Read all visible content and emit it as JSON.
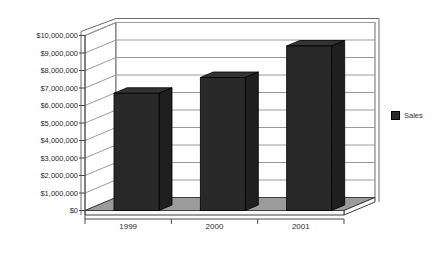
{
  "legend": {
    "label": "Sales",
    "swatch_color": "#292929"
  },
  "colors": {
    "background": "#ffffff",
    "bar_front": "#292929",
    "bar_top": "#333333",
    "bar_side": "#1f1f1f",
    "bar_edge": "#000000",
    "wall_fill": "#ffffff",
    "wall_border": "#6b6b6b",
    "gridline": "#9a9a9a",
    "floor_top": "#9b9b9b",
    "floor_side": "#f7f7f7",
    "floor_border": "#3f3f3f",
    "axis": "#4a4a4a",
    "text": "#2b2b2b"
  },
  "chart_data": {
    "type": "bar",
    "projection": "3d",
    "title": "",
    "xlabel": "",
    "ylabel": "",
    "categories": [
      "1999",
      "2000",
      "2001"
    ],
    "series": [
      {
        "name": "Sales",
        "values": [
          6700000,
          7600000,
          9400000
        ]
      }
    ],
    "ylim": [
      0,
      10000000
    ],
    "ytick_step": 1000000,
    "ytick_labels": [
      "$0",
      "$1,000,000",
      "$2,000,000",
      "$3,000,000",
      "$4,000,000",
      "$5,000,000",
      "$6,000,000",
      "$7,000,000",
      "$8,000,000",
      "$9,000,000",
      "$10,000,000"
    ],
    "gridlines": true,
    "legend_position": "right"
  }
}
